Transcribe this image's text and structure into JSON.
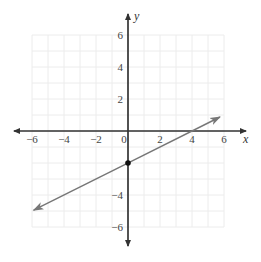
{
  "chart_data": {
    "type": "line",
    "title": "",
    "xlabel": "x",
    "ylabel": "y",
    "xlim": [
      -6,
      6
    ],
    "ylim": [
      -6,
      6
    ],
    "grid": true,
    "x_ticks": [
      -6,
      -4,
      -2,
      0,
      2,
      4,
      6
    ],
    "x_tick_labels": [
      "−6",
      "−4",
      "−2",
      "0",
      "2",
      "4",
      "6"
    ],
    "y_ticks": [
      6,
      4,
      2,
      -4,
      -6
    ],
    "y_tick_labels": [
      "6",
      "4",
      "2",
      "−4",
      "−6"
    ],
    "series": [
      {
        "name": "line",
        "equation": "y = 0.5x - 2",
        "slope": 0.5,
        "intercept": -2,
        "x_start": -5.9,
        "x_end": 5.75,
        "arrows_both_ends": true,
        "color": "#777777"
      }
    ],
    "points": [
      {
        "x": 0,
        "y": -2,
        "label": ""
      }
    ]
  },
  "style": {
    "axis_color": "#333333",
    "line_color": "#777777",
    "grid_color": "#ececec",
    "point_color": "#111111"
  },
  "layout": {
    "origin_px": [
      128,
      131
    ],
    "unit_px": 16,
    "x_axis_px": [
      14,
      246
    ],
    "y_axis_px": [
      14,
      246
    ]
  }
}
